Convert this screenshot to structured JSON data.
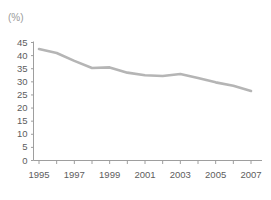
{
  "chart_data": {
    "type": "line",
    "title": "",
    "xlabel": "",
    "ylabel": "",
    "unit_label": "(%)",
    "x": [
      1995,
      1996,
      1997,
      1998,
      1999,
      2000,
      2001,
      2002,
      2003,
      2004,
      2005,
      2006,
      2007
    ],
    "values": [
      42.5,
      41.0,
      38.0,
      35.3,
      35.5,
      33.5,
      32.5,
      32.2,
      33.0,
      31.5,
      29.8,
      28.5,
      26.5
    ],
    "series": [
      {
        "name": "rate",
        "values": [
          42.5,
          41.0,
          38.0,
          35.3,
          35.5,
          33.5,
          32.5,
          32.2,
          33.0,
          31.5,
          29.8,
          28.5,
          26.5
        ]
      }
    ],
    "xlim": [
      1995,
      2007
    ],
    "ylim": [
      0,
      45
    ],
    "ytick_labels": [
      "45",
      "40",
      "35",
      "30",
      "25",
      "20",
      "15",
      "10",
      "5",
      "0"
    ],
    "ytick_values": [
      45,
      40,
      35,
      30,
      25,
      20,
      15,
      10,
      5,
      0
    ],
    "xtick_labels": [
      "1995",
      "1997",
      "1999",
      "2001",
      "2003",
      "2005",
      "2007"
    ],
    "xtick_values": [
      1995,
      1997,
      1999,
      2001,
      2003,
      2005,
      2007
    ],
    "minor_xtick_values": [
      1995,
      1996,
      1997,
      1998,
      1999,
      2000,
      2001,
      2002,
      2003,
      2004,
      2005,
      2006,
      2007
    ],
    "grid": false,
    "legend": null,
    "legend_position": "none",
    "colors": {
      "line": "#b5b5b5",
      "axis": "#9e9e9e",
      "tick_text": "#5d5d5d",
      "unit_text": "#9a9a9a",
      "background": "#ffffff"
    },
    "line_width": 2.6
  }
}
